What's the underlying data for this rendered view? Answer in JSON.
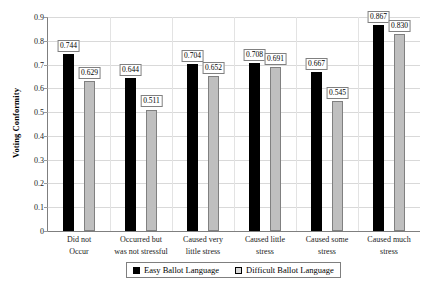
{
  "chart_data": {
    "type": "bar",
    "title": "",
    "xlabel": "",
    "ylabel": "Voting Conformity",
    "ylim": [
      0,
      0.9
    ],
    "ytick_labels": [
      "0",
      "0.1",
      "0.2",
      "0.3",
      "0.4",
      "0.5",
      "0.6",
      "0.7",
      "0.8",
      "0.9"
    ],
    "ytick_values": [
      0,
      0.1,
      0.2,
      0.3,
      0.4,
      0.5,
      0.6,
      0.7,
      0.8,
      0.9
    ],
    "grid": true,
    "legend_position": "bottom",
    "categories": [
      "Did not Occur",
      "Occurred but was not stressful",
      "Caused very little stress",
      "Caused little stress",
      "Caused some stress",
      "Caused much stress"
    ],
    "category_lines": [
      [
        "Did not",
        "Occur"
      ],
      [
        "Occurred but",
        "was not stressful"
      ],
      [
        "Caused very",
        "little stress"
      ],
      [
        "Caused little",
        "stress"
      ],
      [
        "Caused some",
        "stress"
      ],
      [
        "Caused much",
        "stress"
      ]
    ],
    "series": [
      {
        "name": "Easy Ballot Language",
        "color": "#000000",
        "values": [
          0.744,
          0.644,
          0.704,
          0.708,
          0.667,
          0.867
        ],
        "labels": [
          "0.744",
          "0.644",
          "0.704",
          "0.708",
          "0.667",
          "0.867"
        ]
      },
      {
        "name": "Difficult Ballot Language",
        "color": "#bfbfbf",
        "values": [
          0.629,
          0.511,
          0.652,
          0.691,
          0.545,
          0.83
        ],
        "labels": [
          "0.629",
          "0.511",
          "0.652",
          "0.691",
          "0.545",
          "0.830"
        ]
      }
    ]
  },
  "legend": {
    "items": [
      {
        "label": "Easy Ballot Language"
      },
      {
        "label": "Difficult Ballot Language"
      }
    ]
  }
}
